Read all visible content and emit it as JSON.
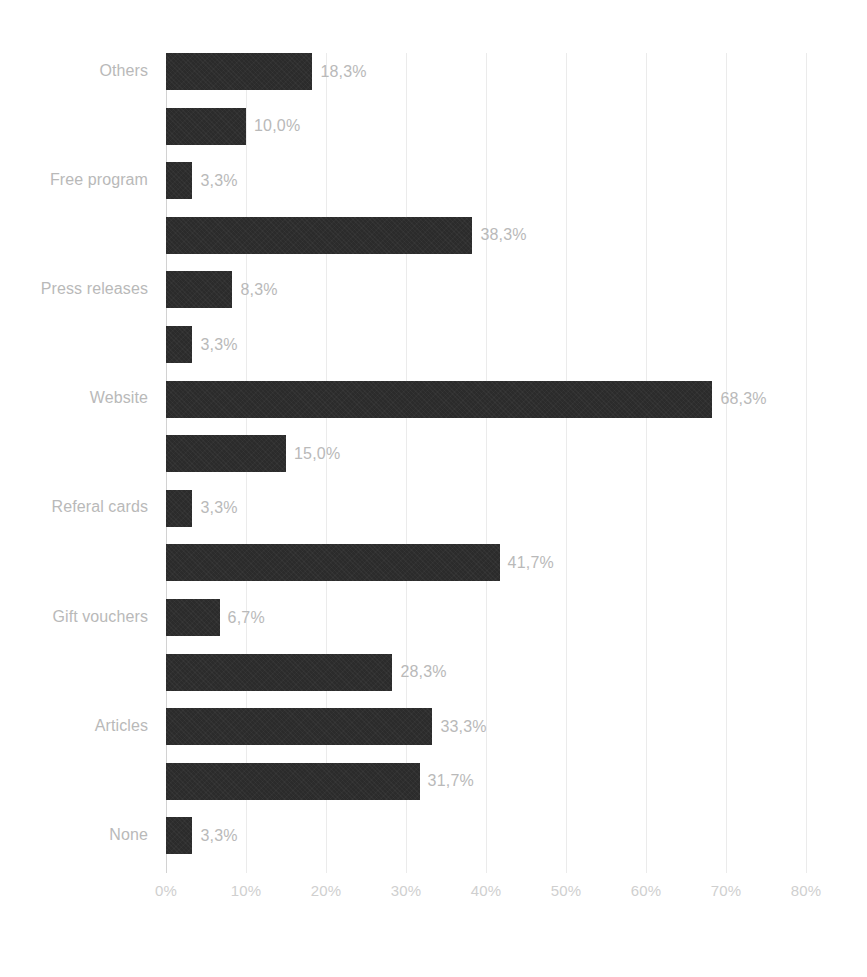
{
  "chart_data": {
    "type": "bar",
    "orientation": "horizontal",
    "title": "",
    "subtitle": "",
    "xlabel": "",
    "ylabel": "",
    "xlim": [
      0,
      80
    ],
    "xtick_labels": [
      "0%",
      "10%",
      "20%",
      "30%",
      "40%",
      "50%",
      "60%",
      "70%",
      "80%"
    ],
    "xtick_values": [
      0,
      10,
      20,
      30,
      40,
      50,
      60,
      70,
      80
    ],
    "grid": true,
    "legend": false,
    "value_suffix": "%",
    "decimal_separator": ",",
    "bar_color": "#2b2b2b",
    "label_color": "#b9b9b9",
    "gridline_color": "#ebebeb",
    "axis_color": "#d2d2d2",
    "categories": [
      "Others",
      "Free program",
      "Press releases",
      "Website",
      "Referal cards",
      "Gift vouchers",
      "Articles",
      "None"
    ],
    "bars": [
      {
        "index": 0,
        "value": 18.3,
        "label": "18,3%",
        "category": "Others",
        "show_category": true
      },
      {
        "index": 1,
        "value": 10.0,
        "label": "10,0%",
        "category": "",
        "show_category": false
      },
      {
        "index": 2,
        "value": 3.3,
        "label": "3,3%",
        "category": "Free program",
        "show_category": true
      },
      {
        "index": 3,
        "value": 38.3,
        "label": "38,3%",
        "category": "",
        "show_category": false
      },
      {
        "index": 4,
        "value": 8.3,
        "label": "8,3%",
        "category": "Press releases",
        "show_category": true
      },
      {
        "index": 5,
        "value": 3.3,
        "label": "3,3%",
        "category": "",
        "show_category": false
      },
      {
        "index": 6,
        "value": 68.3,
        "label": "68,3%",
        "category": "Website",
        "show_category": true
      },
      {
        "index": 7,
        "value": 15.0,
        "label": "15,0%",
        "category": "",
        "show_category": false
      },
      {
        "index": 8,
        "value": 3.3,
        "label": "3,3%",
        "category": "Referal cards",
        "show_category": true
      },
      {
        "index": 9,
        "value": 41.7,
        "label": "41,7%",
        "category": "",
        "show_category": false
      },
      {
        "index": 10,
        "value": 6.7,
        "label": "6,7%",
        "category": "Gift vouchers",
        "show_category": true
      },
      {
        "index": 11,
        "value": 28.3,
        "label": "28,3%",
        "category": "",
        "show_category": false
      },
      {
        "index": 12,
        "value": 33.3,
        "label": "33,3%",
        "category": "Articles",
        "show_category": true
      },
      {
        "index": 13,
        "value": 31.7,
        "label": "31,7%",
        "category": "",
        "show_category": false
      },
      {
        "index": 14,
        "value": 3.3,
        "label": "3,3%",
        "category": "None",
        "show_category": true
      }
    ]
  },
  "geometry": {
    "plot_left": 166,
    "plot_top": 53,
    "px_per_percent": 8.0,
    "bar_height": 37,
    "row_pitch": 54.6,
    "value_gap": 8
  }
}
